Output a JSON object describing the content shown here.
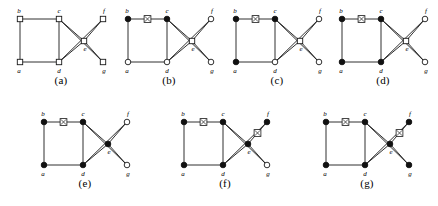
{
  "figure": {
    "width": 438,
    "height": 206,
    "background": "#ffffff",
    "ink_color": "#1a1a1a",
    "filled_node_color": "#111111",
    "open_node_color": "#ffffff"
  },
  "vertex_labels": {
    "a": "a",
    "b": "b",
    "c": "c",
    "d": "d",
    "e": "e",
    "f": "f",
    "g": "g"
  },
  "graph": {
    "vertices": [
      "a",
      "b",
      "c",
      "d",
      "e",
      "f",
      "g"
    ],
    "positions": {
      "a": [
        14,
        62
      ],
      "b": [
        14,
        19
      ],
      "c": [
        53,
        19
      ],
      "d": [
        53,
        62
      ],
      "e": [
        78,
        41
      ],
      "f": [
        97,
        19
      ],
      "g": [
        97,
        62
      ]
    },
    "edges": [
      [
        "a",
        "b"
      ],
      [
        "b",
        "c"
      ],
      [
        "a",
        "d"
      ],
      [
        "c",
        "d"
      ],
      [
        "c",
        "e"
      ],
      [
        "d",
        "e"
      ],
      [
        "c",
        "g"
      ],
      [
        "d",
        "f"
      ],
      [
        "e",
        "f"
      ],
      [
        "e",
        "g"
      ]
    ]
  },
  "panels": [
    {
      "id": "a",
      "caption": "(a)",
      "filled": [],
      "square_nodes": [
        "a",
        "b",
        "c",
        "d",
        "e",
        "f",
        "g"
      ],
      "markers": []
    },
    {
      "id": "b",
      "caption": "(b)",
      "filled": [
        "b",
        "c"
      ],
      "square_nodes": [
        "e"
      ],
      "markers": [
        [
          "b",
          "c"
        ]
      ]
    },
    {
      "id": "c",
      "caption": "(c)",
      "filled": [
        "a",
        "b",
        "c"
      ],
      "square_nodes": [
        "e"
      ],
      "markers": [
        [
          "b",
          "c"
        ]
      ]
    },
    {
      "id": "d",
      "caption": "(d)",
      "filled": [
        "a",
        "b",
        "c",
        "d"
      ],
      "square_nodes": [
        "e"
      ],
      "markers": [
        [
          "b",
          "c"
        ]
      ]
    },
    {
      "id": "e",
      "caption": "(e)",
      "filled": [
        "a",
        "b",
        "c",
        "d",
        "e"
      ],
      "square_nodes": [],
      "markers": [
        [
          "b",
          "c"
        ]
      ]
    },
    {
      "id": "f",
      "caption": "(f)",
      "filled": [
        "a",
        "b",
        "c",
        "d",
        "e",
        "f"
      ],
      "square_nodes": [],
      "markers": [
        [
          "b",
          "c"
        ],
        [
          "e",
          "f"
        ]
      ]
    },
    {
      "id": "g",
      "caption": "(g)",
      "filled": [
        "a",
        "b",
        "c",
        "d",
        "e",
        "f",
        "g"
      ],
      "square_nodes": [],
      "markers": [
        [
          "b",
          "c"
        ],
        [
          "e",
          "f"
        ]
      ]
    }
  ],
  "layout": {
    "rows": [
      {
        "panel_ids": [
          "a",
          "b",
          "c",
          "d"
        ],
        "top": 0,
        "lefts": [
          6,
          114,
          222,
          328
        ]
      },
      {
        "panel_ids": [
          "e",
          "f",
          "g"
        ],
        "top": 103,
        "lefts": [
          30,
          170,
          312
        ]
      }
    ]
  }
}
